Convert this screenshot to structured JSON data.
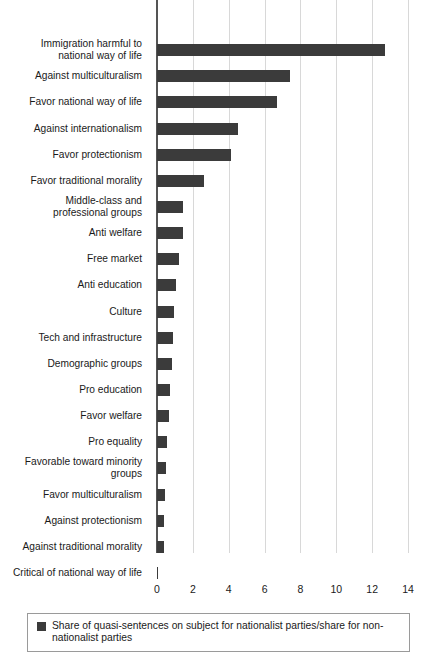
{
  "chart_data": {
    "type": "bar",
    "orientation": "horizontal",
    "title": "",
    "xlabel": "",
    "ylabel": "",
    "xlim": [
      0,
      14
    ],
    "xticks": [
      0,
      2,
      4,
      6,
      8,
      10,
      12,
      14
    ],
    "grid": true,
    "legend_position": "bottom",
    "series_name": "Share of quasi-sentences on subject for nationalist parties/share for non-nationalist parties",
    "series_color": "#3b3b3b",
    "categories": [
      "Immigration harmful to\nnational way of life",
      "Against multiculturalism",
      "Favor national way of life",
      "Against internationalism",
      "Favor protectionism",
      "Favor traditional morality",
      "Middle-class and\nprofessional groups",
      "Anti welfare",
      "Free market",
      "Anti education",
      "Culture",
      "Tech and infrastructure",
      "Demographic groups",
      "Pro education",
      "Favor welfare",
      "Pro equality",
      "Favorable toward minority\ngroups",
      "Favor multiculturalism",
      "Against protectionism",
      "Against traditional morality",
      "Critical of national way of life"
    ],
    "values": [
      12.7,
      7.4,
      6.7,
      4.5,
      4.1,
      2.6,
      1.45,
      1.45,
      1.25,
      1.05,
      0.95,
      0.9,
      0.85,
      0.75,
      0.65,
      0.55,
      0.5,
      0.45,
      0.4,
      0.4,
      0.05
    ]
  },
  "legend": {
    "swatch_name": "legend-color-swatch",
    "label": "Share of quasi-sentences on subject for nationalist parties/share for non-nationalist parties"
  }
}
